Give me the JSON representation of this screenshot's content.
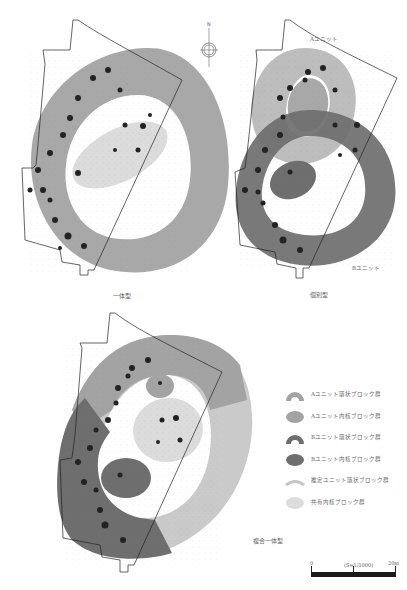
{
  "figures": [
    {
      "id": "ittai",
      "caption": "一体型"
    },
    {
      "id": "kobetsu",
      "caption": "個別型",
      "unit_labels": [
        "Aユニット",
        "Bユニット"
      ]
    },
    {
      "id": "fukugo",
      "caption": "複合一体型"
    }
  ],
  "north_arrow": {
    "label": "N"
  },
  "legend": {
    "items": [
      {
        "symbol": "arc",
        "color": "#a3a3a3",
        "label": "Aユニット環状ブロック群"
      },
      {
        "symbol": "ellipse",
        "color": "#a3a3a3",
        "label": "Aユニット内核ブロック群"
      },
      {
        "symbol": "arc",
        "color": "#6e6e6e",
        "label": "Bユニット環状ブロック群"
      },
      {
        "symbol": "ellipse",
        "color": "#6e6e6e",
        "label": "Bユニット内核ブロック群"
      },
      {
        "symbol": "arc-thin",
        "color": "#c4c4c4",
        "label": "推定ユニット環状ブロック群"
      },
      {
        "symbol": "ellipse",
        "color": "#dcdcdc",
        "label": "共有内核ブロック群"
      }
    ]
  },
  "scale_bar": {
    "start": "0",
    "ratio": "(S=1/1000)",
    "end": "20m"
  },
  "colors": {
    "a_ring": "#a3a3a3",
    "b_ring": "#6e6e6e",
    "shared_core": "#dcdcdc",
    "estimated_ring": "#c8c8c8",
    "outline": "#222222"
  }
}
